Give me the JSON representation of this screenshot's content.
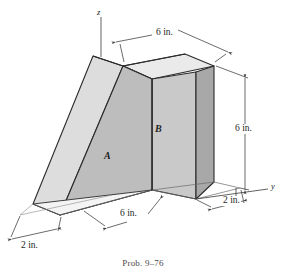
{
  "figure": {
    "caption": "Prob. 9–76",
    "axes": {
      "z_label": "z",
      "y_label": "y"
    },
    "parts": [
      {
        "id": "A",
        "label": "A",
        "shape": "triangular-wedge"
      },
      {
        "id": "B",
        "label": "B",
        "shape": "rectangular-block"
      }
    ],
    "dimensions": [
      {
        "name": "top-width",
        "label": "6 in.",
        "value": 6,
        "unit": "in."
      },
      {
        "name": "right-height",
        "label": "6 in.",
        "value": 6,
        "unit": "in."
      },
      {
        "name": "base-depth",
        "label": "6 in.",
        "value": 6,
        "unit": "in."
      },
      {
        "name": "block-thickness",
        "label": "2 in.",
        "value": 2,
        "unit": "in."
      },
      {
        "name": "wedge-thickness",
        "label": "2 in.",
        "value": 2,
        "unit": "in."
      }
    ],
    "colors": {
      "face_front": "#c9c9c9",
      "face_top": "#e6e6e6",
      "face_side": "#a8a8a8",
      "face_wedge_slope": "#dcdcdc",
      "face_wedge_front": "#bdbdbd",
      "outline": "#2b2b2b",
      "dimension_line": "#3a3a3a",
      "background": "#ffffff"
    }
  }
}
